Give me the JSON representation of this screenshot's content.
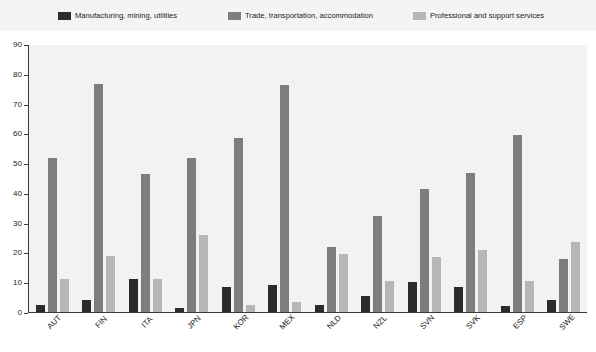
{
  "chart_data": {
    "type": "bar",
    "title": "",
    "subtitle": "",
    "xlabel": "",
    "ylabel": "",
    "ylim": [
      0,
      90
    ],
    "yticks": [
      0,
      10,
      20,
      30,
      40,
      50,
      60,
      70,
      80,
      90
    ],
    "grid": false,
    "legend_position": "top",
    "categories": [
      "AUT",
      "FIN",
      "ITA",
      "JPN",
      "KOR",
      "MEX",
      "NLD",
      "NZL",
      "SVN",
      "SVK",
      "ESP",
      "SWE"
    ],
    "series": [
      {
        "name": "Manufacturing, mining, utilities",
        "color": "#2b2b2b",
        "values": [
          2.5,
          4,
          11,
          1.5,
          8.5,
          9,
          2.5,
          5.5,
          10,
          8.5,
          2,
          4
        ]
      },
      {
        "name": "Trade, transportation, accommodation",
        "color": "#7d7d7d",
        "values": [
          52,
          77,
          46.5,
          52,
          58.5,
          76.5,
          22,
          32.5,
          41.5,
          47,
          59.5,
          18
        ]
      },
      {
        "name": "Professional and support services",
        "color": "#b6b6b6",
        "values": [
          11,
          19,
          11,
          26,
          2.5,
          3.5,
          19.5,
          10.5,
          18.5,
          21,
          10.5,
          23.5
        ]
      }
    ]
  },
  "legend": {
    "items": [
      {
        "label": "Manufacturing, mining, utilities",
        "color": "#2b2b2b",
        "swatch": "legend-swatch-dark"
      },
      {
        "label": "Trade, transportation, accommodation",
        "color": "#7d7d7d",
        "swatch": "legend-swatch-medium"
      },
      {
        "label": "Professional and support services",
        "color": "#b6b6b6",
        "swatch": "legend-swatch-light"
      }
    ]
  },
  "colors": {
    "series_1": "#2b2b2b",
    "series_2": "#7d7d7d",
    "series_3": "#b6b6b6",
    "plot_background": "#f2f2f2",
    "legend_background": "#f4f4f4",
    "axis": "#3a3a3a",
    "text": "#1d1d1d"
  }
}
